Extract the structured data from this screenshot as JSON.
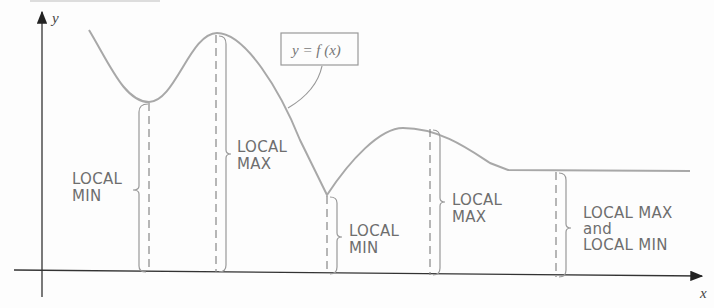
{
  "figure": {
    "y_axis_label": "y",
    "x_axis_label": "x",
    "function_label": "y = f (x)",
    "annotations": [
      {
        "id": "min1",
        "lines": [
          "LOCAL",
          "MIN"
        ]
      },
      {
        "id": "max1",
        "lines": [
          "LOCAL",
          "MAX"
        ]
      },
      {
        "id": "min2",
        "lines": [
          "LOCAL",
          "MIN"
        ]
      },
      {
        "id": "max2",
        "lines": [
          "LOCAL",
          "MAX"
        ]
      },
      {
        "id": "flat",
        "lines": [
          "LOCAL MAX",
          "and",
          "LOCAL MIN"
        ]
      }
    ],
    "colors": {
      "curve": "#a8a8a8",
      "axis": "#333333",
      "text": "#6e6e6e"
    }
  }
}
